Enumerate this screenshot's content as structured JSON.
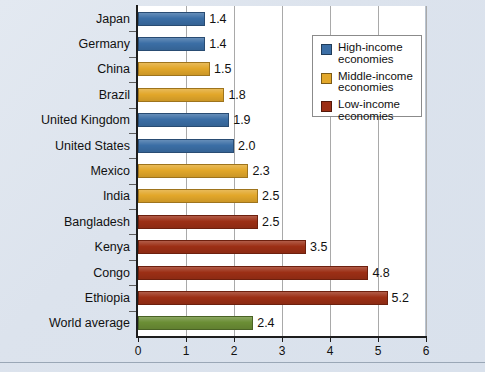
{
  "chart_data": {
    "type": "bar",
    "orientation": "horizontal",
    "title": "",
    "xlabel": "",
    "ylabel": "",
    "xlim": [
      0,
      6
    ],
    "xticks": [
      "0",
      "1",
      "2",
      "3",
      "4",
      "5",
      "6"
    ],
    "grid": true,
    "legend_position": "top-right",
    "categories": [
      "Japan",
      "Germany",
      "China",
      "Brazil",
      "United Kingdom",
      "United States",
      "Mexico",
      "India",
      "Bangladesh",
      "Kenya",
      "Congo",
      "Ethiopia",
      "World average"
    ],
    "values": [
      1.4,
      1.4,
      1.5,
      1.8,
      1.9,
      2.0,
      2.3,
      2.5,
      2.5,
      3.5,
      4.8,
      5.2,
      2.4
    ],
    "value_labels": [
      "1.4",
      "1.4",
      "1.5",
      "1.8",
      "1.9",
      "2.0",
      "2.3",
      "2.5",
      "2.5",
      "3.5",
      "4.8",
      "5.2",
      "2.4"
    ],
    "groups": [
      "high",
      "high",
      "middle",
      "middle",
      "high",
      "high",
      "middle",
      "middle",
      "low",
      "low",
      "low",
      "low",
      "world"
    ],
    "legend": [
      {
        "key": "high",
        "label": "High-income economies",
        "color": "#3b6ea5"
      },
      {
        "key": "middle",
        "label": "Middle-income economies",
        "color": "#e2a72a"
      },
      {
        "key": "low",
        "label": "Low-income economies",
        "color": "#9c2f15"
      }
    ],
    "colors": {
      "high": "#3b6ea5",
      "middle": "#e2a72a",
      "low": "#9c2f15",
      "world": "#6b8e35",
      "background": "#dde4ee",
      "plot_background": "#ffffff",
      "axis": "#1d1d1d",
      "gridline": "#a9a9a9"
    }
  }
}
